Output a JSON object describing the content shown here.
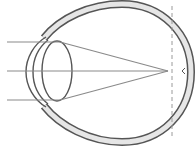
{
  "diagram": {
    "colors": {
      "background": "#ffffff",
      "outline": "#555555",
      "sclera_fill": "#e6e6e6",
      "ray": "#8a8a8a",
      "focal_dash": "#9a9a9a"
    },
    "rays": [
      {
        "y": 42
      },
      {
        "y": 71
      },
      {
        "y": 100
      }
    ],
    "focal_point": {
      "x": 168,
      "y": 71
    },
    "retina_plane_x": 172
  }
}
